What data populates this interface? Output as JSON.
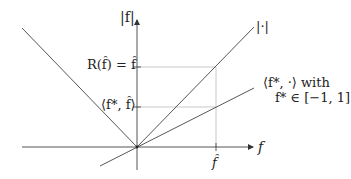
{
  "diagram": {
    "axes": {
      "x_label": "f",
      "y_label": "|f|",
      "x_tick_label": "f̂",
      "origin": [
        137,
        147
      ]
    },
    "y_tick_labels": {
      "upper": "R(f̂) = f̂",
      "lower": "⟨f*, f̂⟩"
    },
    "curve_labels": {
      "abs": "|·|",
      "linear_line1": "⟨f*, ·⟩ with",
      "linear_line2": "f* ∈ [−1, 1]"
    },
    "colors": {
      "axis": "#555555",
      "line": "#444444",
      "guide": "#bbbbbb",
      "text": "#222222"
    }
  }
}
